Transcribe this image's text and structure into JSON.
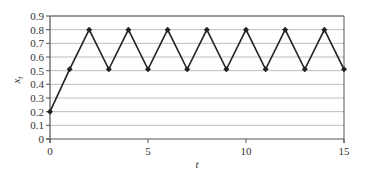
{
  "chart_data": {
    "type": "line",
    "title": "",
    "xlabel": "t",
    "ylabel": "x_t",
    "ylabel_main": "x",
    "ylabel_sub": "t",
    "xlim": [
      0,
      15
    ],
    "ylim": [
      0,
      0.9
    ],
    "x_ticks": [
      0,
      5,
      10,
      15
    ],
    "x_tick_labels": [
      "0",
      "5",
      "10",
      "15"
    ],
    "y_ticks": [
      0,
      0.1,
      0.2,
      0.3,
      0.4,
      0.5,
      0.6,
      0.7,
      0.8,
      0.9
    ],
    "y_tick_labels": [
      "0",
      "0.1",
      "0.2",
      "0.3",
      "0.4",
      "0.5",
      "0.6",
      "0.7",
      "0.8",
      "0.9"
    ],
    "grid": "horizontal",
    "legend": null,
    "series": [
      {
        "name": "x_t",
        "marker": "diamond",
        "color": "#222222",
        "x": [
          0,
          1,
          2,
          3,
          4,
          5,
          6,
          7,
          8,
          9,
          10,
          11,
          12,
          13,
          14,
          15
        ],
        "values": [
          0.2,
          0.51,
          0.8,
          0.51,
          0.8,
          0.51,
          0.8,
          0.51,
          0.8,
          0.51,
          0.8,
          0.51,
          0.8,
          0.51,
          0.8,
          0.51
        ]
      }
    ]
  },
  "colors": {
    "line": "#222222",
    "axis": "#333333",
    "grid": "#bdbdbd",
    "frame": "#555555"
  }
}
